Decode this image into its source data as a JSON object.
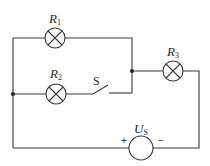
{
  "diagram": {
    "type": "circuit",
    "components": {
      "R1": {
        "label_main": "R",
        "label_sub": "1",
        "kind": "lamp"
      },
      "R2": {
        "label_main": "R",
        "label_sub": "2",
        "kind": "lamp"
      },
      "R3": {
        "label_main": "R",
        "label_sub": "3",
        "kind": "lamp"
      },
      "S": {
        "label": "S",
        "kind": "switch",
        "state": "open"
      },
      "Us": {
        "label_main": "U",
        "label_sub": "S",
        "kind": "voltage-source",
        "plus": "+",
        "minus": "−"
      }
    },
    "colors": {
      "wire": "#3a3a3a",
      "background": "#ffffff"
    }
  }
}
